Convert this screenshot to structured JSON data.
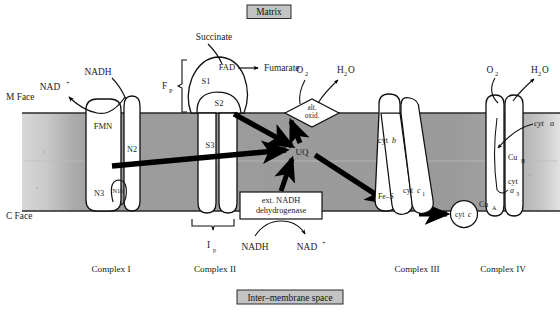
{
  "figure": {
    "type": "diagram",
    "background_color": "#ffffff",
    "membrane_color": "#9a9a9a",
    "protein_fill": "#ffffff",
    "outline_color": "#111111",
    "arrow_color": "#000000"
  },
  "compartments": {
    "matrix_label": "Matrix",
    "intermembrane_label": "Inter–membrane space",
    "m_face_label": "M Face",
    "c_face_label": "C Face"
  },
  "complexes": [
    {
      "id": "complex-1",
      "caption": "Complex I",
      "subunit_labels": [
        "FMN",
        "N2",
        "N3",
        "N1b"
      ]
    },
    {
      "id": "complex-2",
      "caption": "Complex II",
      "subunit_labels": [
        "S1",
        "S2",
        "S3",
        "FAD"
      ],
      "bracket_labels": [
        "F",
        "P",
        "I",
        "p"
      ]
    },
    {
      "id": "complex-3",
      "caption": "Complex III",
      "subunit_labels": [
        "cyt",
        "b",
        "Fe–S",
        "cyt",
        "c",
        "1"
      ]
    },
    {
      "id": "complex-4",
      "caption": "Complex IV",
      "subunit_labels": [
        "cyt",
        "a",
        "Cu",
        "B",
        "cyt",
        "a",
        "3",
        "Cu",
        "A"
      ]
    }
  ],
  "labels": {
    "nad_plus_left": "NAD",
    "nad_plus_left_sup": "+",
    "nadh_left": "NADH",
    "succinate": "Succinate",
    "fumarate": "Fumarate",
    "fad": "FAD",
    "s1": "S1",
    "s2": "S2",
    "s3": "S3",
    "fmn": "FMN",
    "n2": "N2",
    "n3": "N3",
    "n1b": "N1b",
    "fp_main": "F",
    "fp_sub": "P",
    "ip_main": "I",
    "ip_sub": "p",
    "uq": "UQ",
    "alt_oxid_line1": "alt.",
    "alt_oxid_line2": "oxid.",
    "o2_left": "O",
    "o2_left_sub": "2",
    "h2o_left": "H",
    "h2o_left_sub": "2",
    "h2o_left_tail": "O",
    "o2_right": "O",
    "o2_right_sub": "2",
    "h2o_right": "H",
    "h2o_right_sub": "2",
    "h2o_right_tail": "O",
    "ext_ndh_line1": "ext. NADH",
    "ext_ndh_line2": "dehydrogenase",
    "nadh_ext": "NADH",
    "nad_plus_ext": "NAD",
    "nad_plus_ext_sup": "+",
    "cyt_b_main": "cyt",
    "cyt_b_ital": "b",
    "fe_s": "Fe–S",
    "cyt_c1_main": "cyt",
    "cyt_c1_ital": "c",
    "cyt_c1_sub": "1",
    "cyt_c_main": "cyt",
    "cyt_c_ital": "c",
    "cyt_a_main": "cyt",
    "cyt_a_ital": "a",
    "cu_b_main": "Cu",
    "cu_b_sub": "B",
    "cyt_a3_main": "cyt",
    "cyt_a3_ital": "a",
    "cyt_a3_sub": "3",
    "cu_a_main": "Cu",
    "cu_a_sub": "A"
  },
  "captions": {
    "complex_1": "Complex I",
    "complex_2": "Complex II",
    "complex_3": "Complex III",
    "complex_4": "Complex IV"
  }
}
